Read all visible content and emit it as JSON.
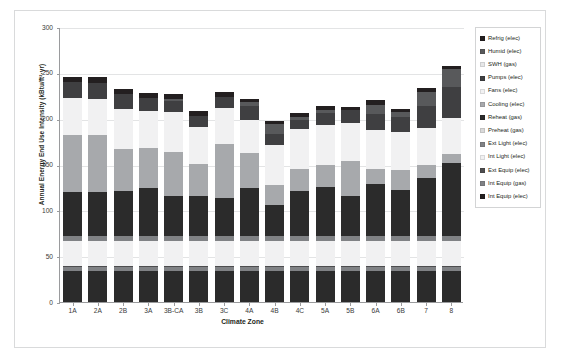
{
  "chart_data": {
    "type": "bar",
    "subtype": "stacked-bar",
    "title": "",
    "xlabel": "Climate Zone",
    "ylabel": "Annual Energy End Use Intensity (kBtu/ft²·yr)",
    "ylim": [
      0,
      300
    ],
    "yticks": [
      0,
      50,
      100,
      150,
      200,
      250,
      300
    ],
    "grid": true,
    "legend_position": "right",
    "categories": [
      "1A",
      "2A",
      "2B",
      "3A",
      "3B-CA",
      "3B",
      "3C",
      "4A",
      "4B",
      "4C",
      "5A",
      "5B",
      "6A",
      "6B",
      "7",
      "8"
    ],
    "series": [
      {
        "name": "Int Equip (elec)",
        "color": "#2b2b2b",
        "values": [
          34,
          34,
          34,
          34,
          34,
          34,
          34,
          34,
          34,
          34,
          34,
          34,
          34,
          34,
          34,
          34
        ]
      },
      {
        "name": "Int Equip (gas)",
        "color": "#808285",
        "values": [
          4,
          4,
          4,
          4,
          4,
          4,
          4,
          4,
          4,
          4,
          4,
          4,
          4,
          4,
          4,
          4
        ]
      },
      {
        "name": "Ext Equip (elec)",
        "color": "#4d4d4f",
        "values": [
          1,
          1,
          1,
          1,
          1,
          1,
          1,
          1,
          1,
          1,
          1,
          1,
          1,
          1,
          1,
          1
        ]
      },
      {
        "name": "Int Light (elec)",
        "color": "#f1f1f2",
        "values": [
          28,
          28,
          28,
          28,
          28,
          28,
          28,
          28,
          28,
          28,
          28,
          28,
          28,
          28,
          28,
          28
        ]
      },
      {
        "name": "Ext Light (elec)",
        "color": "#808285",
        "values": [
          5,
          5,
          5,
          5,
          5,
          5,
          5,
          5,
          5,
          5,
          5,
          5,
          5,
          5,
          5,
          5
        ]
      },
      {
        "name": "Preheat (gas)",
        "color": "#d9d9d9",
        "values": [
          0,
          0,
          0,
          0,
          0,
          0,
          0,
          0,
          0,
          0,
          0,
          0,
          0,
          0,
          0,
          0
        ]
      },
      {
        "name": "Reheat (gas)",
        "color": "#2b2b2b",
        "values": [
          48,
          48,
          49,
          52,
          44,
          44,
          42,
          52,
          34,
          49,
          54,
          44,
          57,
          50,
          63,
          80
        ]
      },
      {
        "name": "Cooling (elec)",
        "color": "#a7a9ac",
        "values": [
          62,
          62,
          46,
          44,
          48,
          35,
          58,
          39,
          22,
          24,
          24,
          38,
          16,
          22,
          14,
          9
        ]
      },
      {
        "name": "Fans (elec)",
        "color": "#f1f1f2",
        "values": [
          41,
          40,
          44,
          40,
          43,
          40,
          40,
          36,
          43,
          44,
          43,
          41,
          43,
          42,
          41,
          40
        ]
      },
      {
        "name": "Pumps (elec)",
        "color": "#3f3f41",
        "values": [
          17,
          17,
          16,
          15,
          12,
          12,
          12,
          15,
          12,
          10,
          13,
          14,
          17,
          16,
          24,
          34
        ]
      },
      {
        "name": "SWH (gas)",
        "color": "#e6e7e8",
        "values": [
          0,
          0,
          0,
          0,
          0,
          0,
          0,
          0,
          0,
          0,
          0,
          0,
          0,
          0,
          0,
          0
        ]
      },
      {
        "name": "Humid (elec)",
        "color": "#58595b",
        "values": [
          0,
          0,
          0,
          0,
          3,
          0,
          0,
          4,
          11,
          3,
          4,
          0,
          10,
          5,
          15,
          19
        ]
      },
      {
        "name": "Refrig (elec)",
        "color": "#231f20",
        "values": [
          6,
          6,
          6,
          5,
          5,
          5,
          5,
          4,
          4,
          4,
          4,
          4,
          5,
          4,
          4,
          4
        ]
      }
    ],
    "totals": [
      246,
      245,
      238,
      234,
      221,
      203,
      229,
      219,
      200,
      206,
      215,
      215,
      241,
      216,
      249,
      279
    ]
  },
  "legend": {
    "items": [
      {
        "label": "Refrig (elec)",
        "color": "#231f20"
      },
      {
        "label": "Humid (elec)",
        "color": "#58595b"
      },
      {
        "label": "SWH (gas)",
        "color": "#e6e7e8"
      },
      {
        "label": "Pumps (elec)",
        "color": "#3f3f41"
      },
      {
        "label": "Fans (elec)",
        "color": "#f1f1f2"
      },
      {
        "label": "Cooling (elec)",
        "color": "#a7a9ac"
      },
      {
        "label": "Reheat (gas)",
        "color": "#2b2b2b"
      },
      {
        "label": "Preheat (gas)",
        "color": "#d9d9d9"
      },
      {
        "label": "Ext Light (elec)",
        "color": "#808285"
      },
      {
        "label": "Int Light (elec)",
        "color": "#f1f1f2"
      },
      {
        "label": "Ext Equip (elec)",
        "color": "#4d4d4f"
      },
      {
        "label": "Int Equip (gas)",
        "color": "#808285"
      },
      {
        "label": "Int Equip (elec)",
        "color": "#231f20"
      }
    ]
  },
  "colors": {
    "axis": "#9a9b9d",
    "grid": "#e3e4e5",
    "frame": "#d9dadb",
    "text": "#231f20",
    "background": "#ffffff"
  }
}
